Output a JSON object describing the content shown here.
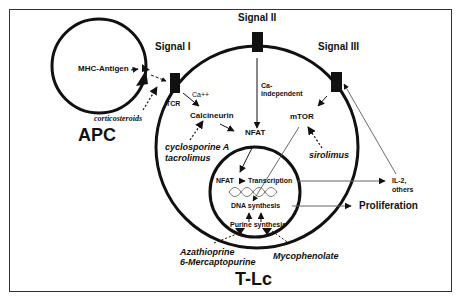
{
  "diagram": {
    "cells": {
      "apc": "APC",
      "tlc": "T-Lc"
    },
    "signals": {
      "signal1": "Signal I",
      "signal2": "Signal II",
      "signal3": "Signal III"
    },
    "nodes": {
      "mhc_antigen": "MHC-Antigen",
      "tcr": "TCR",
      "ca": "Ca++",
      "calcineurin": "Calcineurin",
      "ca_independent_1": "Ca-",
      "ca_independent_2": "independent",
      "nfat": "NFAT",
      "mtor": "mTOR",
      "nfat_nucleus": "NFAT",
      "transcription": "Transcription",
      "dna_synthesis": "DNA synthesis",
      "purine_synthesis": "Purine synthesis",
      "il2_1": "IL-2,",
      "il2_2": "others",
      "proliferation": "Proliferation"
    },
    "drugs": {
      "corticosteroids": "corticosteroids",
      "cyclosporine": "cyclosporine A",
      "tacrolimus": "tacrolimus",
      "sirolimus": "sirolimus",
      "azathioprine": "Azathioprine",
      "mercaptopurine": "6-Mercaptopurine",
      "mycophenolate": "Mycophenolate"
    },
    "colors": {
      "line": "#111111",
      "frame": "#333333",
      "thin_line": "#444444"
    }
  }
}
